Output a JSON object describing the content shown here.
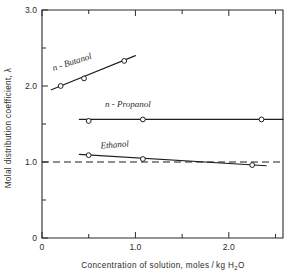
{
  "chart_data": {
    "type": "line",
    "title": "",
    "xlabel": "Concentration of solution, moles/kg H2O",
    "xlabel_main": "Concentration of solution, moles / kg H",
    "xlabel_sub": "2",
    "xlabel_tail": "O",
    "ylabel": "Molal distribution coefficient, λ",
    "xlim": [
      0,
      2.58
    ],
    "ylim": [
      0,
      3.0
    ],
    "xticks": [
      0,
      0.5,
      1.0,
      1.5,
      2.0,
      2.5
    ],
    "xticklabels": [
      "0",
      "",
      "1.0",
      "",
      "2.0",
      ""
    ],
    "yticks": [
      0,
      0.5,
      1.0,
      1.5,
      2.0,
      2.5,
      3.0
    ],
    "yticklabels": [
      "0",
      "",
      "1.0",
      "",
      "2.0",
      "",
      "3.0"
    ],
    "grid": false,
    "legend_position": "inline-annotations",
    "series": [
      {
        "name": "n - Butanol",
        "label": "n - Butanol",
        "label_x": 0.33,
        "label_y": 2.28,
        "label_rotation": -18,
        "x": [
          0.2,
          0.45,
          0.88
        ],
        "y": [
          2.0,
          2.1,
          2.33
        ],
        "fit_x": [
          0.1,
          1.0
        ],
        "fit_y": [
          1.95,
          2.4
        ]
      },
      {
        "name": "n - Propanol",
        "label": "n - Propanol",
        "label_x": 0.92,
        "label_y": 1.73,
        "label_rotation": 0,
        "x": [
          0.5,
          1.08,
          2.35
        ],
        "y": [
          1.54,
          1.56,
          1.56
        ],
        "fit_x": [
          0.4,
          2.58
        ],
        "fit_y": [
          1.56,
          1.56
        ]
      },
      {
        "name": "Ethanol",
        "label": "Ethanol",
        "label_x": 0.78,
        "label_y": 1.19,
        "label_rotation": -4,
        "x": [
          0.5,
          1.08,
          2.25
        ],
        "y": [
          1.09,
          1.04,
          0.96
        ],
        "fit_x": [
          0.4,
          2.4
        ],
        "fit_y": [
          1.1,
          0.95
        ]
      }
    ],
    "reference_line": {
      "name": "unity-reference",
      "value": 1.0,
      "style": "dashed",
      "x_start": 0.0,
      "x_end": 2.58
    }
  },
  "figure": {
    "background_color": "#ffffff",
    "line_color": "#1f1f1f",
    "axis_color": "#2b2b2b"
  }
}
